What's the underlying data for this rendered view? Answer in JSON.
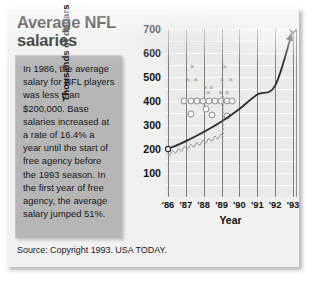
{
  "graphic": {
    "title": "Average NFL salaries",
    "body_text": "In 1986, the average salary for NFL players was less than $200,000. Base salaries increased at a rate of 16.4% a year until the start of free agency before the 1993 season. In the first year of free agency, the average salary jumped 51%.",
    "source": "Source: Copyright 1993. USA TODAY."
  },
  "chart_data": {
    "type": "line",
    "title": "Average NFL salaries",
    "xlabel": "Year",
    "ylabel": "Thousands of dollars",
    "categories": [
      "'86",
      "'87",
      "'88",
      "'89",
      "'90",
      "'91",
      "'92",
      "'93"
    ],
    "x": [
      1986,
      1987,
      1988,
      1989,
      1990,
      1991,
      1992,
      1993
    ],
    "values": [
      200,
      233,
      271,
      315,
      367,
      427,
      464,
      700
    ],
    "series": [
      {
        "name": "Average salary",
        "values": [
          200,
          233,
          271,
          315,
          367,
          427,
          464,
          700
        ]
      }
    ],
    "ylim": [
      0,
      700
    ],
    "xlim": [
      "'86",
      "'93"
    ],
    "yticks": [
      700,
      600,
      500,
      400,
      300,
      200,
      100
    ],
    "ytick_labels": [
      "700",
      "600",
      "500",
      "400",
      "300",
      "200",
      "100"
    ],
    "grid": true,
    "grid_orientation": "horizontal",
    "legend": false,
    "annotations": [
      "Base salaries increased at a rate of 16.4% a year",
      "Average salary jumped 51% in first year of free agency (1993)"
    ],
    "line_color": "#2b2b2b",
    "plot_background": "#eaeae8",
    "endpoint_marker": true
  },
  "colors": {
    "card_background": "#f1f1f0",
    "text_panel": "#b6b6b6",
    "plot_background": "#eaeae8",
    "gridline": "#ffffff",
    "axis": "#7e7e7e",
    "text": "#141414",
    "curve": "#2b2b2b"
  }
}
